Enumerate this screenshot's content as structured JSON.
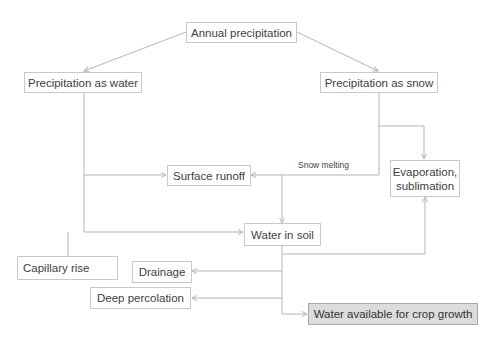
{
  "diagram": {
    "nodes": {
      "annual": "Annual precipitation",
      "water": "Precipitation as water",
      "snow": "Precipitation as snow",
      "runoff": "Surface runoff",
      "evap_line1": "Evaporation,",
      "evap_line2": "sublimation",
      "soil": "Water in soil",
      "capillary": "Capillary rise",
      "drainage": "Drainage",
      "percolation": "Deep percolation",
      "crop": "Water available for crop growth"
    },
    "edge_labels": {
      "snow_melting": "Snow melting"
    },
    "colors": {
      "line": "#b5b5b5",
      "box_border": "#c9c9c9",
      "highlight_fill": "#dcdcdc",
      "text": "#404040"
    }
  }
}
